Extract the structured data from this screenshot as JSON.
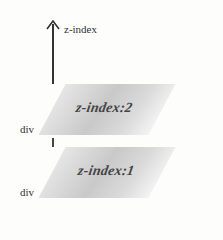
{
  "axis": {
    "label": "z-index",
    "icon": "arrow-up-icon"
  },
  "layers": [
    {
      "label": "z-index:2",
      "element": "div",
      "z": 2
    },
    {
      "label": "z-index:1",
      "element": "div",
      "z": 1
    }
  ],
  "colors": {
    "plane": "#cfcfcf",
    "line": "#333333",
    "background": "#fdfdfc"
  }
}
